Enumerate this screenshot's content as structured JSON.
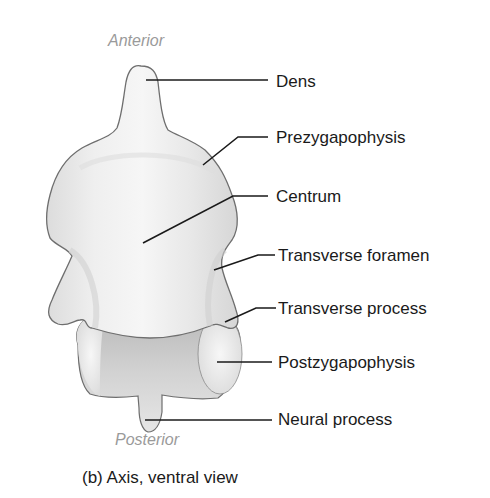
{
  "figure": {
    "caption": "(b) Axis, ventral view",
    "orientation": {
      "top": "Anterior",
      "bottom": "Posterior"
    },
    "labels": [
      {
        "id": "dens",
        "text": "Dens"
      },
      {
        "id": "prezygapophysis",
        "text": "Prezygapophysis"
      },
      {
        "id": "centrum",
        "text": "Centrum"
      },
      {
        "id": "transverse-foramen",
        "text": "Transverse foramen"
      },
      {
        "id": "transverse-process",
        "text": "Transverse process"
      },
      {
        "id": "postzygapophysis",
        "text": "Postzygapophysis"
      },
      {
        "id": "neural-process",
        "text": "Neural process"
      }
    ],
    "colors": {
      "bone_fill": "#ececec",
      "bone_shadow": "#c8c8c8",
      "outline": "#6e6e6e",
      "leader_line": "#1a1a1a",
      "orientation_text": "#9a9a9a",
      "label_text": "#1a1a1a"
    }
  }
}
